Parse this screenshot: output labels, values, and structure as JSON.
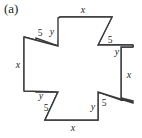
{
  "figure": {
    "caption": "(a)",
    "shape_name": "pinwheel-polygon",
    "stroke_color": "#3a3a3c",
    "fill_color": "#ffffff",
    "text_color": "#231f20",
    "background_color": "#ffffff"
  },
  "labels": {
    "top_x": "x",
    "top_left_y": "y",
    "top_left_5": "5",
    "left_x": "x",
    "top_right_5": "5",
    "top_right_y": "y",
    "right_x": "x",
    "bottom_left_y": "y",
    "bottom_left_5": "5",
    "bottom_x": "x",
    "bottom_right_y": "y",
    "bottom_right_5": "5"
  },
  "geometry": {
    "outline_points": "60,17 112,17 112,18 98,45 133,45 133,47 120,47 120,100 132,100 132,101 98,92 98,119 97,120 45,120 45,119 58,92 24,92 24,91 36,91 36,38 24,38 24,37 58,46 58,18",
    "viewbox": "0 0 142 138"
  }
}
